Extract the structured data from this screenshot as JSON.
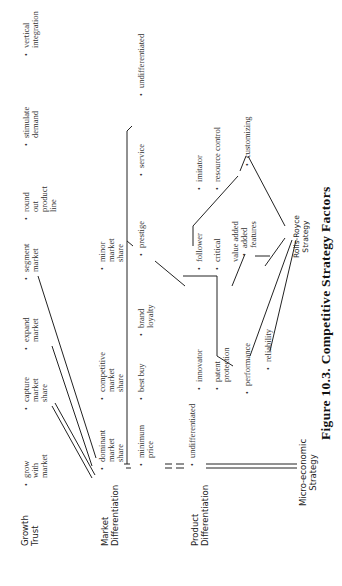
{
  "figure": {
    "caption": "Figure 10.3. Competitive Strategy Factors",
    "orientation": "rotated 90° counterclockwise"
  },
  "rows": [
    {
      "label": "Growth\nTrust",
      "items": [
        "grow\nwith\nmarket",
        "capture\nmarket\nshare",
        "expand\nmarket",
        "segment\nmarket",
        "round\nout\nproduct\nline",
        "stimulate\ndemand",
        "vertical\nintegration"
      ]
    },
    {
      "label": "Market\nDifferentiation",
      "items": [
        "dominant\nmarket\nshare",
        "competitive\nmarket\nshare",
        "minor\nmarket\nshare"
      ],
      "sub_items": [
        "minimum\nprice",
        "best buy",
        "brand\nloyalty",
        "prestige",
        "service",
        "undifferentiated"
      ]
    },
    {
      "label": "Product\nDifferentiation",
      "items": [
        "undifferentiated",
        "innovator",
        "patent\nprotection",
        "follower",
        "critical",
        "value added",
        "imitator",
        "resource control"
      ],
      "features": [
        "performance",
        "reliability",
        "added\nfeatures",
        "customizing"
      ]
    },
    {
      "label": "Micro-economic\nStrategy",
      "items": []
    }
  ],
  "strategy_node": "Rolls-Royce\nStrategy"
}
